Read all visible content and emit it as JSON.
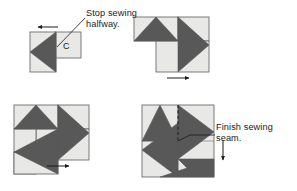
{
  "figure": {
    "type": "instructional-diagram",
    "panel_count": 4,
    "colors": {
      "dark_triangle": "#585858",
      "light_patch": "#e8e8e6",
      "outline": "#6d6d6d",
      "text": "#1b1b1b",
      "arrow": "#1b1b1b",
      "background": "#ffffff"
    }
  },
  "annotations": {
    "stop_sewing": {
      "line1": "Stop sewing",
      "line2": "halfway.",
      "leader": "leader-line-to-seam-end",
      "arrow_direction": "left"
    },
    "finish_sewing": {
      "line1": "Finish sewing",
      "line2": "seam.",
      "leader": "leader-line-to-final-seam",
      "arrow_direction": "down"
    }
  },
  "patch_labels": {
    "c": "C"
  },
  "panels": [
    {
      "id": "panel-1",
      "position": "top-left",
      "description": "Base square with dark triangle pointing left plus patch C attached top-right",
      "arrow": "left",
      "annotation": "stop_sewing",
      "patch_label": "C"
    },
    {
      "id": "panel-2",
      "position": "top-right",
      "description": "Two units joined, second patch added, arrow pointing right",
      "arrow": "right",
      "annotation": null,
      "patch_label": null
    },
    {
      "id": "panel-3",
      "position": "bottom-left",
      "description": "Three units of pinwheel assembled, arrow pointing right",
      "arrow": "right",
      "annotation": null,
      "patch_label": null
    },
    {
      "id": "panel-4",
      "position": "bottom-right",
      "description": "Completed pinwheel block with dashed final seam, arrow pointing down",
      "arrow": "down",
      "annotation": "finish_sewing",
      "patch_label": null
    }
  ]
}
